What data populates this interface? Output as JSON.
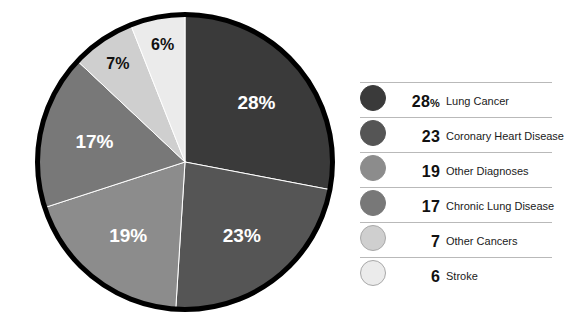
{
  "chart_data": {
    "type": "pie",
    "title": "",
    "subtitle": "",
    "xlabel": "",
    "ylabel": "",
    "unit": "%",
    "total": 100,
    "legend_position": "right",
    "grid": false,
    "start_angle_deg": 0,
    "direction": "clockwise",
    "categories": [
      "Lung Cancer",
      "Coronary Heart Disease",
      "Other Diagnoses",
      "Chronic Lung Disease",
      "Other Cancers",
      "Stroke"
    ],
    "values": [
      28,
      23,
      19,
      17,
      7,
      6
    ],
    "slice_labels": [
      "28%",
      "23%",
      "19%",
      "17%",
      "7%",
      "6%"
    ],
    "colors": [
      "#3a3a3a",
      "#555555",
      "#8c8c8c",
      "#787878",
      "#cfcfcf",
      "#ebebeb"
    ],
    "label_colors": [
      "#ffffff",
      "#ffffff",
      "#ffffff",
      "#ffffff",
      "#111111",
      "#111111"
    ],
    "outline_color": "#000000",
    "outline_width": 5
  },
  "pie": {
    "slices": [
      {
        "label": "28%",
        "value": 28,
        "color": "#3a3a3a",
        "label_color": "#ffffff"
      },
      {
        "label": "23%",
        "value": 23,
        "color": "#555555",
        "label_color": "#ffffff"
      },
      {
        "label": "19%",
        "value": 19,
        "color": "#8c8c8c",
        "label_color": "#ffffff"
      },
      {
        "label": "17%",
        "value": 17,
        "color": "#787878",
        "label_color": "#ffffff"
      },
      {
        "label": "7%",
        "value": 7,
        "color": "#cfcfcf",
        "label_color": "#111111"
      },
      {
        "label": "6%",
        "value": 6,
        "color": "#ebebeb",
        "label_color": "#111111"
      }
    ]
  },
  "legend": {
    "items": [
      {
        "value": "28",
        "suffix": "%",
        "label": "Lung Cancer",
        "color": "#3a3a3a",
        "border": "#3a3a3a"
      },
      {
        "value": "23",
        "suffix": "",
        "label": "Coronary Heart Disease",
        "color": "#555555",
        "border": "#555555"
      },
      {
        "value": "19",
        "suffix": "",
        "label": "Other Diagnoses",
        "color": "#8c8c8c",
        "border": "#8c8c8c"
      },
      {
        "value": "17",
        "suffix": "",
        "label": "Chronic Lung Disease",
        "color": "#787878",
        "border": "#787878"
      },
      {
        "value": "7",
        "suffix": "",
        "label": "Other Cancers",
        "color": "#cfcfcf",
        "border": "#a8a8a8"
      },
      {
        "value": "6",
        "suffix": "",
        "label": "Stroke",
        "color": "#ebebeb",
        "border": "#a8a8a8"
      }
    ]
  }
}
